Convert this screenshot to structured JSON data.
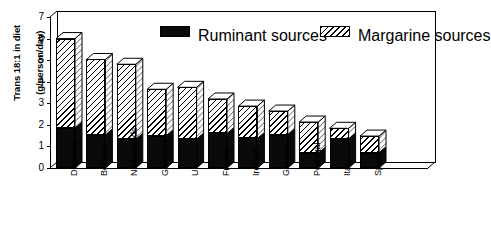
{
  "chart_data": {
    "type": "bar",
    "subtype": "stacked-3d-column",
    "title": "",
    "xlabel": "",
    "ylabel": "Trans 18:1 in diet (g/person/day)",
    "ylabel_lines": [
      "Trans 18:1 in diet",
      "(g/person/day)"
    ],
    "ylim": [
      0,
      7
    ],
    "yticks": [
      0,
      1,
      2,
      3,
      4,
      5,
      6,
      7
    ],
    "ytick_labels": [
      "0",
      "1",
      "2",
      "3",
      "4",
      "5",
      "6",
      "7"
    ],
    "grid": false,
    "legend_position": "top-inside",
    "categories": [
      "Denmark",
      "Belgium",
      "Netherlands",
      "Germany",
      "UK",
      "France",
      "Ireland",
      "Greece",
      "Portugal",
      "Italy",
      "Spain"
    ],
    "series": [
      {
        "name": "Ruminant sources",
        "fill": "solid-black",
        "color": "#000000",
        "values": [
          1.85,
          1.53,
          1.33,
          1.5,
          1.34,
          1.6,
          1.37,
          1.54,
          0.68,
          1.34,
          0.71
        ]
      },
      {
        "name": "Margarine sources",
        "fill": "diagonal-hatch",
        "color": "#ffffff",
        "values": [
          4.15,
          3.5,
          3.48,
          2.15,
          2.4,
          1.6,
          1.5,
          1.1,
          1.45,
          0.5,
          0.77
        ]
      }
    ],
    "totals": [
      6.0,
      5.03,
      4.81,
      3.65,
      3.74,
      3.2,
      2.87,
      2.64,
      2.13,
      1.84,
      1.48
    ]
  },
  "legend": {
    "items": [
      {
        "label": "Ruminant sources",
        "swatch": "black-swatch"
      },
      {
        "label": "Margarine sources",
        "swatch": "hatched-swatch"
      }
    ]
  }
}
